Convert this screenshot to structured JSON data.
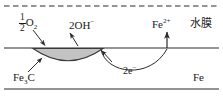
{
  "diagram": {
    "labels": {
      "oxygen": {
        "fraction_numerator": "1",
        "fraction_denominator": "2",
        "species": "O",
        "species_sub": "2"
      },
      "hydroxide": {
        "text": "2OH",
        "charge": "−"
      },
      "ferrous_ion": {
        "text": "Fe",
        "charge": "2+"
      },
      "water_film": {
        "text": "水膜"
      },
      "cementite": {
        "text": "Fe",
        "sub": "3",
        "text2": "C"
      },
      "electrons": {
        "text": "2e",
        "charge": "−"
      },
      "iron": {
        "text": "Fe"
      }
    },
    "colors": {
      "line": "#2b2b2b",
      "shade_fill": "#c3c3c3",
      "shade_stroke": "#3a3a3a",
      "text": "#1a1a1a",
      "background": "#ffffff"
    },
    "geometry": {
      "dashed_water_line_y": 6,
      "surface_line_y": 48,
      "bottom_line_y": 89,
      "cathode_region": {
        "x_start": 33,
        "x_end": 103,
        "depth": 18
      },
      "electron_arc": {
        "x_start": 101,
        "x_end": 167,
        "depth": 30
      },
      "fe2_arrow_x": 167
    },
    "icon_names": [
      "down-right-arrow-icon",
      "up-left-arrow-icon",
      "up-right-arrow-icon",
      "up-left-arrow-icon-2",
      "up-arrow-icon"
    ]
  }
}
